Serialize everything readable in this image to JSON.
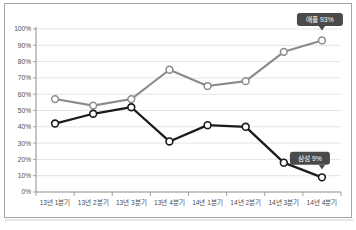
{
  "chart_data": {
    "type": "line",
    "title": "",
    "subtitle": "",
    "xlabel": "",
    "ylabel": "",
    "ylim": [
      0,
      100
    ],
    "grid": true,
    "legend_position": "none",
    "categories": [
      "13년 1분기",
      "13년 2분기",
      "13년 3분기",
      "13년 4분기",
      "14년 1분기",
      "14년 2분기",
      "14년 3분기",
      "14년 4분기"
    ],
    "ytick_labels": [
      "100%",
      "90%",
      "80%",
      "70%",
      "60%",
      "50%",
      "40%",
      "30%",
      "20%",
      "10%",
      "0%"
    ],
    "ytick_values": [
      100,
      90,
      80,
      70,
      60,
      50,
      40,
      30,
      20,
      10,
      0
    ],
    "series": [
      {
        "name": "애플",
        "color": "#8e8b86",
        "values": [
          57,
          53,
          57,
          75,
          65,
          68,
          86,
          93
        ]
      },
      {
        "name": "삼성",
        "color": "#1b1b1b",
        "values": [
          42,
          48,
          52,
          31,
          41,
          40,
          18,
          9
        ]
      }
    ],
    "annotations": [
      {
        "id": "apple-callout",
        "text": "애플 93%",
        "series": "애플",
        "point_index": 7,
        "value": 93,
        "background": "#4a4a4a",
        "text_color": "#ffffff"
      },
      {
        "id": "samsung-callout",
        "text": "삼성 9%",
        "series": "삼성",
        "point_index": 7,
        "value": 9,
        "background": "#4a4a4a",
        "text_color": "#ffffff"
      }
    ]
  },
  "figure": {
    "border_color": "#a6a6a6",
    "background": "#ffffff",
    "grid_color": "#d9d9d9",
    "axis_color": "#8c8c8c",
    "tick_text_color": "#4b4b4b"
  }
}
